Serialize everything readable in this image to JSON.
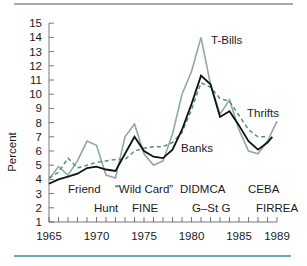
{
  "chart_data": {
    "type": "line",
    "title": "",
    "xlabel": "",
    "ylabel": "Percent",
    "xlim": [
      1965,
      1989
    ],
    "ylim": [
      1,
      15
    ],
    "grid": false,
    "y_ticks": [
      1,
      2,
      3,
      4,
      5,
      6,
      7,
      8,
      9,
      10,
      11,
      12,
      13,
      14,
      15
    ],
    "x_tick_labels": [
      "1965",
      "1970",
      "1975",
      "1980",
      "1985",
      "1989"
    ],
    "x": [
      1965,
      1966,
      1967,
      1968,
      1969,
      1970,
      1971,
      1972,
      1973,
      1974,
      1975,
      1976,
      1977,
      1978,
      1979,
      1980,
      1981,
      1982,
      1983,
      1984,
      1985,
      1986,
      1987,
      1988,
      1989
    ],
    "series": [
      {
        "name": "T-Bills",
        "style": "solid-gray",
        "color": "#8fa8a6",
        "values": [
          4.0,
          4.9,
          4.3,
          5.3,
          6.7,
          6.4,
          4.3,
          4.1,
          7.0,
          7.9,
          5.8,
          5.0,
          5.3,
          7.2,
          10.0,
          11.6,
          14.0,
          10.7,
          8.6,
          9.6,
          7.5,
          6.0,
          5.8,
          6.7,
          8.1
        ]
      },
      {
        "name": "Banks",
        "style": "solid-black",
        "color": "#111111",
        "values": [
          3.7,
          4.0,
          4.2,
          4.4,
          4.8,
          4.9,
          4.7,
          4.6,
          5.8,
          7.0,
          6.0,
          5.6,
          5.5,
          6.1,
          7.5,
          9.3,
          11.3,
          10.7,
          8.4,
          8.8,
          7.8,
          6.7,
          6.1,
          6.6,
          7.0
        ]
      },
      {
        "name": "Thrifts",
        "style": "dashed-teal",
        "color": "#4f8f8c",
        "values": [
          4.1,
          4.5,
          5.5,
          4.8,
          5.0,
          5.2,
          5.3,
          5.4,
          5.4,
          6.0,
          6.2,
          6.3,
          6.3,
          6.6,
          7.3,
          8.9,
          10.8,
          10.5,
          9.7,
          9.5,
          8.5,
          7.5,
          7.0,
          7.0,
          null
        ]
      }
    ],
    "series_labels": {
      "tbills": "T-Bills",
      "banks": "Banks",
      "thrifts": "Thrifts"
    },
    "annotations": [
      {
        "text": "Friend",
        "row": 1
      },
      {
        "text": "“Wild Card”",
        "row": 1
      },
      {
        "text": "DIDMCA",
        "row": 1
      },
      {
        "text": "CEBA",
        "row": 1
      },
      {
        "text": "Hunt",
        "row": 2
      },
      {
        "text": "FINE",
        "row": 2
      },
      {
        "text": "G–St G",
        "row": 2
      },
      {
        "text": "FIRREA",
        "row": 2
      }
    ],
    "legend_position": "inline labels"
  },
  "labels": {
    "ylabel": "Percent",
    "tbills": "T-Bills",
    "banks": "Banks",
    "thrifts": "Thrifts",
    "friend": "Friend",
    "wildcard": "“Wild Card”",
    "didmca": "DIDMCA",
    "ceba": "CEBA",
    "hunt": "Hunt",
    "fine": "FINE",
    "gstg": "G–St G",
    "firrea": "FIRREA",
    "y": [
      "1",
      "2",
      "3",
      "4",
      "5",
      "6",
      "7",
      "8",
      "9",
      "10",
      "11",
      "12",
      "13",
      "14",
      "15"
    ],
    "x": [
      "1965",
      "1970",
      "1975",
      "1980",
      "1985",
      "1989"
    ]
  },
  "colors": {
    "top_rule": "#555555",
    "bottom_rule": "#3d8a8e",
    "tbills": "#8fa8a6",
    "banks": "#111111",
    "thrifts": "#4f8f8c"
  }
}
